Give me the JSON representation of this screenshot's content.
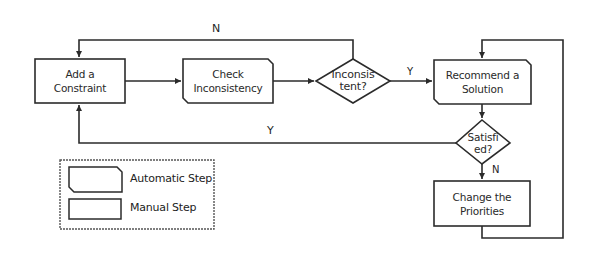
{
  "diagram": {
    "nodes": [
      {
        "id": "add-constraint",
        "type": "manual-step",
        "line1": "Add a",
        "line2": "Constraint"
      },
      {
        "id": "check-inconsistency",
        "type": "automatic-step",
        "line1": "Check",
        "line2": "Inconsistency"
      },
      {
        "id": "inconsistent",
        "type": "decision",
        "line1": "Inconsis",
        "line2": "tent?"
      },
      {
        "id": "recommend-solution",
        "type": "automatic-step",
        "line1": "Recommend a",
        "line2": "Solution"
      },
      {
        "id": "satisfied",
        "type": "decision",
        "line1": "Satisfi",
        "line2": "ed?"
      },
      {
        "id": "change-priorities",
        "type": "manual-step",
        "line1": "Change the",
        "line2": "Priorities"
      }
    ],
    "edge_labels": {
      "inconsistent_no": "N",
      "inconsistent_yes": "Y",
      "satisfied_yes": "Y",
      "satisfied_no": "N"
    },
    "legend": {
      "automatic": "Automatic Step",
      "manual": "Manual Step"
    },
    "colors": {
      "stroke": "#2b2b2b",
      "background": "#ffffff",
      "legend_border": "#555555"
    }
  }
}
